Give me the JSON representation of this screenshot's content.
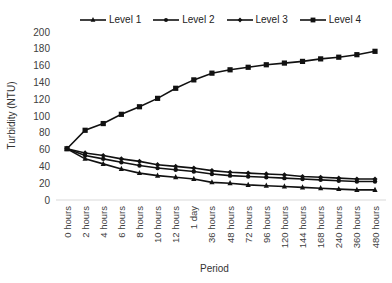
{
  "chart_data": {
    "type": "line",
    "title": "",
    "xlabel": "Period",
    "ylabel": "Turbidity (NTU)",
    "ylim": [
      0,
      200
    ],
    "yticks": [
      0,
      20,
      40,
      60,
      80,
      100,
      120,
      140,
      160,
      180,
      200
    ],
    "grid": false,
    "legend_position": "top",
    "categories": [
      "0 hours",
      "2 hours",
      "4 hours",
      "6 hours",
      "8 hours",
      "10 hours",
      "12 hours",
      "1 day",
      "36 hours",
      "48 hours",
      "72 hours",
      "96 hours",
      "120 hours",
      "144 hours",
      "168 hours",
      "240 hours",
      "360 hours",
      "480 hours"
    ],
    "series": [
      {
        "name": "Level 1",
        "marker": "triangle",
        "values": [
          61,
          49,
          43,
          37,
          32,
          29,
          27,
          25,
          21,
          20,
          18,
          17,
          16,
          15,
          14,
          13,
          12,
          12
        ]
      },
      {
        "name": "Level 2",
        "marker": "circle",
        "values": [
          61,
          53,
          49,
          45,
          41,
          38,
          36,
          34,
          31,
          29,
          28,
          27,
          26,
          25,
          24,
          23,
          22,
          22
        ]
      },
      {
        "name": "Level 3",
        "marker": "diamond",
        "values": [
          61,
          56,
          53,
          49,
          46,
          42,
          40,
          38,
          35,
          33,
          32,
          31,
          30,
          28,
          27,
          26,
          25,
          25
        ]
      },
      {
        "name": "Level 4",
        "marker": "square",
        "values": [
          61,
          83,
          91,
          102,
          111,
          121,
          133,
          143,
          151,
          155,
          158,
          161,
          163,
          165,
          168,
          170,
          173,
          177
        ]
      }
    ]
  }
}
